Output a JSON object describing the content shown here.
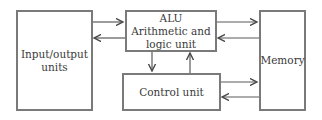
{
  "diagram": {
    "nodes": [
      {
        "id": "io",
        "lines": [
          "Input/output",
          "units"
        ]
      },
      {
        "id": "alu",
        "lines": [
          "ALU",
          "Arithmetic and",
          "logic unit"
        ]
      },
      {
        "id": "control",
        "lines": [
          "Control unit"
        ]
      },
      {
        "id": "memory",
        "lines": [
          "Memory"
        ]
      }
    ],
    "edges": [
      {
        "from": "io",
        "to": "alu"
      },
      {
        "from": "alu",
        "to": "io"
      },
      {
        "from": "alu",
        "to": "memory"
      },
      {
        "from": "memory",
        "to": "alu"
      },
      {
        "from": "alu",
        "to": "control"
      },
      {
        "from": "control",
        "to": "alu"
      },
      {
        "from": "control",
        "to": "memory"
      },
      {
        "from": "memory",
        "to": "control"
      }
    ],
    "colors": {
      "border": "#7a7a7a",
      "arrow": "#4a4a4a",
      "text": "#3a3a3a"
    }
  }
}
